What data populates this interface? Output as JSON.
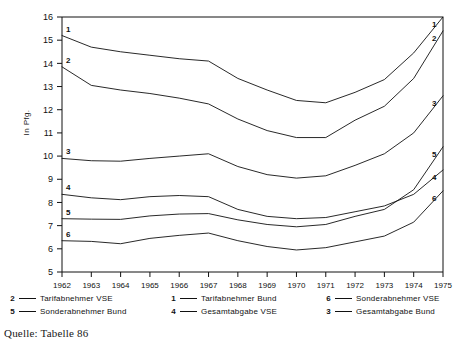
{
  "axis": {
    "y_title": "In Pfg.",
    "y_ticks": [
      5,
      6,
      7,
      8,
      9,
      10,
      11,
      12,
      13,
      14,
      15,
      16
    ],
    "x_ticks": [
      "1962",
      "1963",
      "1964",
      "1965",
      "1966",
      "1967",
      "1968",
      "1969",
      "1970",
      "1971",
      "1972",
      "1973",
      "1974",
      "1975"
    ]
  },
  "legend": {
    "columns": [
      {
        "rows": [
          {
            "key": "2",
            "label": "Tarifabnehmer VSE"
          },
          {
            "key": "5",
            "label": "Sonderabnehmer Bund"
          }
        ]
      },
      {
        "rows": [
          {
            "key": "1",
            "label": "Tarifabnehmer Bund"
          },
          {
            "key": "4",
            "label": "Gesamtabgabe VSE"
          }
        ]
      },
      {
        "rows": [
          {
            "key": "6",
            "label": "Sonderabnehmer VSE"
          },
          {
            "key": "3",
            "label": "Gesamtabgabe Bund"
          }
        ]
      }
    ]
  },
  "source": "Quelle: Tabelle 86",
  "colors": {
    "ink": "#111111",
    "frame": "#111111",
    "background": "#ffffff"
  },
  "chart_data": {
    "type": "line",
    "title": "",
    "xlabel": "",
    "ylabel": "In Pfg.",
    "xlim": [
      "1962",
      "1975"
    ],
    "ylim": [
      5,
      16
    ],
    "grid": false,
    "legend_position": "below",
    "x": [
      "1962",
      "1963",
      "1964",
      "1965",
      "1966",
      "1967",
      "1968",
      "1969",
      "1970",
      "1971",
      "1972",
      "1973",
      "1974",
      "1975"
    ],
    "series": [
      {
        "name": "Tarifabnehmer Bund",
        "key": "1",
        "values": [
          15.2,
          14.7,
          14.5,
          14.35,
          14.2,
          14.1,
          13.35,
          12.85,
          12.4,
          12.3,
          12.75,
          13.3,
          14.45,
          16.0
        ]
      },
      {
        "name": "Tarifabnehmer VSE",
        "key": "2",
        "values": [
          13.85,
          13.05,
          12.85,
          12.7,
          12.5,
          12.25,
          11.6,
          11.1,
          10.8,
          10.8,
          11.55,
          12.15,
          13.35,
          15.4
        ]
      },
      {
        "name": "Gesamtabgabe Bund",
        "key": "3",
        "values": [
          9.9,
          9.8,
          9.78,
          9.9,
          10.0,
          10.1,
          9.55,
          9.2,
          9.05,
          9.15,
          9.6,
          10.1,
          11.0,
          12.6
        ]
      },
      {
        "name": "Gesamtabgabe VSE",
        "key": "4",
        "values": [
          8.35,
          8.2,
          8.12,
          8.25,
          8.3,
          8.25,
          7.7,
          7.4,
          7.3,
          7.35,
          7.6,
          7.85,
          8.35,
          9.4
        ]
      },
      {
        "name": "Sonderabnehmer Bund",
        "key": "5",
        "values": [
          7.3,
          7.28,
          7.27,
          7.42,
          7.5,
          7.52,
          7.25,
          7.05,
          6.95,
          7.05,
          7.4,
          7.7,
          8.55,
          10.4
        ]
      },
      {
        "name": "Sonderabnehmer VSE",
        "key": "6",
        "values": [
          6.35,
          6.32,
          6.22,
          6.45,
          6.58,
          6.68,
          6.35,
          6.1,
          5.95,
          6.05,
          6.3,
          6.55,
          7.15,
          8.5
        ]
      }
    ],
    "series_end_tags": [
      "1",
      "2",
      "3",
      "5",
      "4",
      "6"
    ],
    "series_start_tags": [
      "1",
      "2",
      "3",
      "4",
      "5",
      "6"
    ]
  }
}
